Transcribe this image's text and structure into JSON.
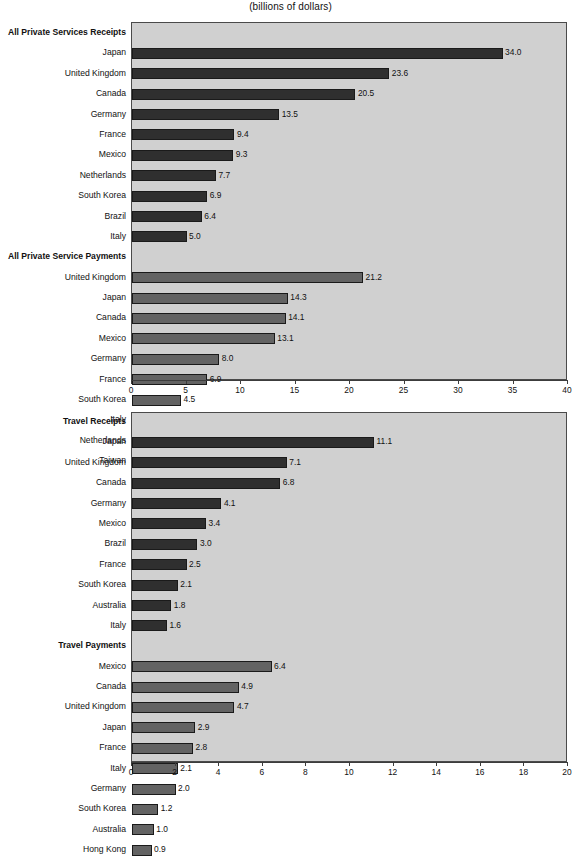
{
  "title": "(billions of dollars)",
  "chart_data": [
    {
      "type": "bar",
      "orientation": "horizontal",
      "title": "(billions of dollars)",
      "xlabel": "",
      "ylabel": "",
      "xlim": [
        0,
        40
      ],
      "xticks": [
        0,
        5,
        10,
        15,
        20,
        25,
        30,
        35,
        40
      ],
      "grid": false,
      "legend": "none",
      "groups": [
        {
          "name": "All Private Services Receipts",
          "style": "receipts",
          "categories": [
            "Japan",
            "United Kingdom",
            "Canada",
            "Germany",
            "France",
            "Mexico",
            "Netherlands",
            "South Korea",
            "Brazil",
            "Italy"
          ],
          "values": [
            34.0,
            23.6,
            20.5,
            13.5,
            9.4,
            9.3,
            7.7,
            6.9,
            6.4,
            5.0
          ],
          "labels": [
            "34.0",
            "23.6",
            "20.5",
            "13.5",
            "9.4",
            "9.3",
            "7.7",
            "6.9",
            "6.4",
            "5.0"
          ]
        },
        {
          "name": "All Private Service Payments",
          "style": "payments",
          "categories": [
            "United Kingdom",
            "Japan",
            "Canada",
            "Mexico",
            "Germany",
            "France",
            "South Korea",
            "Italy",
            "Netherlands",
            "Taiwan"
          ],
          "values": [
            21.2,
            14.3,
            14.1,
            13.1,
            8.0,
            6.9,
            4.5,
            3.7,
            3.5,
            3.4
          ],
          "labels": [
            "21.2",
            "14.3",
            "14.1",
            "13.1",
            "8.0",
            "6.9",
            "4.5",
            "3.7",
            "3.5",
            "3.4"
          ]
        }
      ]
    },
    {
      "type": "bar",
      "orientation": "horizontal",
      "title": "",
      "xlabel": "",
      "ylabel": "",
      "xlim": [
        0,
        20
      ],
      "xticks": [
        0,
        2,
        4,
        6,
        8,
        10,
        12,
        14,
        16,
        18,
        20
      ],
      "grid": false,
      "legend": "none",
      "groups": [
        {
          "name": "Travel Receipts",
          "style": "receipts",
          "categories": [
            "Japan",
            "United Kingdom",
            "Canada",
            "Germany",
            "Mexico",
            "Brazil",
            "France",
            "South Korea",
            "Australia",
            "Italy"
          ],
          "values": [
            11.1,
            7.1,
            6.8,
            4.1,
            3.4,
            3.0,
            2.5,
            2.1,
            1.8,
            1.6
          ],
          "labels": [
            "11.1",
            "7.1",
            "6.8",
            "4.1",
            "3.4",
            "3.0",
            "2.5",
            "2.1",
            "1.8",
            "1.6"
          ]
        },
        {
          "name": "Travel Payments",
          "style": "payments",
          "categories": [
            "Mexico",
            "Canada",
            "United Kingdom",
            "Japan",
            "France",
            "Italy",
            "Germany",
            "South Korea",
            "Australia",
            "Hong Kong"
          ],
          "values": [
            6.4,
            4.9,
            4.7,
            2.9,
            2.8,
            2.1,
            2.0,
            1.2,
            1.0,
            0.9
          ],
          "labels": [
            "6.4",
            "4.9",
            "4.7",
            "2.9",
            "2.8",
            "2.1",
            "2.0",
            "1.2",
            "1.0",
            "0.9"
          ]
        }
      ]
    }
  ],
  "colors": {
    "receipts_bar": "#2f2f2f",
    "payments_bar": "#636363",
    "plot_background": "#d0d0d0",
    "axis": "#3c3c3c",
    "text": "#111111"
  }
}
